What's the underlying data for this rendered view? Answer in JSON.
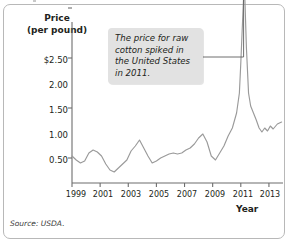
{
  "figure": {
    "title": "States, 1999–2013",
    "source": "Source: USDA.",
    "callout": "The price for raw cotton spiked in the United States in 2011."
  },
  "axes": {
    "ylabel_line1": "Price",
    "ylabel_line2": "(per pound)",
    "xlabel": "Year",
    "yticks": [
      "$2.50",
      "2.00",
      "1.50",
      "1.00",
      "0.50"
    ],
    "ytick_values": [
      2.5,
      2.0,
      1.5,
      1.0,
      0.5
    ],
    "xticks": [
      "1999",
      "2001",
      "2003",
      "2005",
      "2007",
      "2009",
      "2011",
      "2013"
    ],
    "xtick_values": [
      1999,
      2001,
      2003,
      2005,
      2007,
      2009,
      2011,
      2013
    ]
  },
  "colors": {
    "line": "#9a9a9a",
    "axis": "#6d6d6d",
    "callout_bg": "#e2e2e2",
    "border": "#b8b8b8",
    "text": "#231f20"
  },
  "chart_data": {
    "type": "line",
    "title": "States, 1999–2013",
    "xlabel": "Year",
    "ylabel": "Price (per pound)",
    "xlim": [
      1999,
      2014
    ],
    "ylim": [
      0,
      2.5
    ],
    "grid": false,
    "legend": null,
    "annotations": [
      {
        "text": "The price for raw cotton spiked in the United States in 2011.",
        "points_to_x": 2011.2,
        "points_to_y": 2.27
      }
    ],
    "series": [
      {
        "name": "Raw cotton price (US$ per pound)",
        "x": [
          1999.0,
          1999.3,
          1999.6,
          1999.9,
          2000.2,
          2000.5,
          2000.8,
          2001.1,
          2001.4,
          2001.7,
          2002.0,
          2002.3,
          2002.6,
          2002.9,
          2003.2,
          2003.5,
          2003.8,
          2004.1,
          2004.4,
          2004.7,
          2005.0,
          2005.3,
          2005.6,
          2005.9,
          2006.2,
          2006.5,
          2006.8,
          2007.1,
          2007.4,
          2007.7,
          2008.0,
          2008.3,
          2008.6,
          2008.9,
          2009.2,
          2009.5,
          2009.8,
          2010.1,
          2010.4,
          2010.7,
          2010.9,
          2011.0,
          2011.15,
          2011.25,
          2011.4,
          2011.55,
          2011.7,
          2011.9,
          2012.1,
          2012.3,
          2012.5,
          2012.7,
          2012.9,
          2013.1,
          2013.3,
          2013.6,
          2013.9
        ],
        "y": [
          0.52,
          0.48,
          0.45,
          0.47,
          0.55,
          0.58,
          0.56,
          0.52,
          0.44,
          0.38,
          0.36,
          0.4,
          0.44,
          0.48,
          0.57,
          0.62,
          0.68,
          0.6,
          0.52,
          0.45,
          0.47,
          0.5,
          0.52,
          0.54,
          0.55,
          0.54,
          0.55,
          0.58,
          0.6,
          0.64,
          0.7,
          0.74,
          0.66,
          0.52,
          0.48,
          0.55,
          0.62,
          0.72,
          0.8,
          0.95,
          1.15,
          1.45,
          1.95,
          2.27,
          1.6,
          1.15,
          1.02,
          0.95,
          0.88,
          0.8,
          0.76,
          0.8,
          0.77,
          0.82,
          0.79,
          0.84,
          0.86
        ]
      }
    ]
  }
}
